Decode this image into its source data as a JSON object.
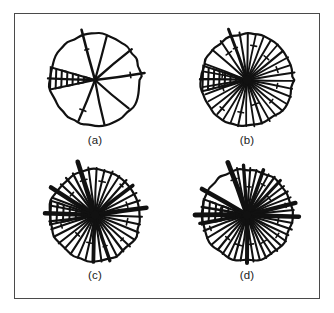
{
  "figure": {
    "title": "",
    "background_color": "#ffffff",
    "ink_color": "#111111",
    "frame_color": "#4a4a4a",
    "frame": {
      "x": 14,
      "y": 13,
      "width": 306,
      "height": 286
    },
    "layout": {
      "rows": 2,
      "cols": 2
    }
  },
  "panels": [
    {
      "id": "a",
      "caption": "(a)",
      "center": {
        "x": 70,
        "y": 58
      },
      "radius": 46,
      "spoke_count": 8,
      "description": "sparse radial diagram with eight spokes and one hatched wedge on the left",
      "hatched_wedge": {
        "start_angle": 168,
        "end_angle": 196,
        "zigzag_count": 7
      },
      "spokes": [
        {
          "angle": 255,
          "length": 52,
          "width": 2.6
        },
        {
          "angle": 285,
          "length": 46,
          "width": 2.2
        },
        {
          "angle": 320,
          "length": 48,
          "width": 2.4
        },
        {
          "angle": 352,
          "length": 50,
          "width": 2.6
        },
        {
          "angle": 40,
          "length": 44,
          "width": 2.2
        },
        {
          "angle": 78,
          "length": 46,
          "width": 2.2
        },
        {
          "angle": 112,
          "length": 44,
          "width": 2.2
        },
        {
          "angle": 182,
          "length": 47,
          "width": 2.4
        }
      ]
    },
    {
      "id": "b",
      "caption": "(b)",
      "center": {
        "x": 70,
        "y": 58
      },
      "radius": 46,
      "spoke_count": 34,
      "description": "dense radial diagram with about thirty-four spokes and a hatched wedge on the left",
      "hatched_wedge": {
        "start_angle": 166,
        "end_angle": 198,
        "zigzag_count": 7
      },
      "spokes": [
        {
          "angle": 250,
          "length": 54,
          "width": 3.0
        },
        {
          "angle": 261,
          "length": 48,
          "width": 2.0
        },
        {
          "angle": 271,
          "length": 47,
          "width": 2.0
        },
        {
          "angle": 281,
          "length": 46,
          "width": 1.8
        },
        {
          "angle": 291,
          "length": 47,
          "width": 1.8
        },
        {
          "angle": 301,
          "length": 46,
          "width": 2.0
        },
        {
          "angle": 311,
          "length": 47,
          "width": 1.8
        },
        {
          "angle": 321,
          "length": 46,
          "width": 2.2
        },
        {
          "angle": 331,
          "length": 47,
          "width": 1.8
        },
        {
          "angle": 341,
          "length": 46,
          "width": 1.8
        },
        {
          "angle": 351,
          "length": 48,
          "width": 2.2
        },
        {
          "angle": 1,
          "length": 47,
          "width": 1.8
        },
        {
          "angle": 11,
          "length": 46,
          "width": 1.8
        },
        {
          "angle": 21,
          "length": 47,
          "width": 2.0
        },
        {
          "angle": 31,
          "length": 46,
          "width": 1.8
        },
        {
          "angle": 41,
          "length": 47,
          "width": 2.0
        },
        {
          "angle": 51,
          "length": 46,
          "width": 1.8
        },
        {
          "angle": 61,
          "length": 47,
          "width": 1.8
        },
        {
          "angle": 71,
          "length": 46,
          "width": 2.2
        },
        {
          "angle": 81,
          "length": 47,
          "width": 1.8
        },
        {
          "angle": 91,
          "length": 46,
          "width": 1.8
        },
        {
          "angle": 101,
          "length": 47,
          "width": 2.0
        },
        {
          "angle": 111,
          "length": 46,
          "width": 1.8
        },
        {
          "angle": 121,
          "length": 46,
          "width": 1.8
        },
        {
          "angle": 131,
          "length": 45,
          "width": 2.0
        },
        {
          "angle": 141,
          "length": 45,
          "width": 1.8
        },
        {
          "angle": 151,
          "length": 44,
          "width": 1.8
        },
        {
          "angle": 161,
          "length": 44,
          "width": 2.0
        },
        {
          "angle": 171,
          "length": 45,
          "width": 1.8
        },
        {
          "angle": 181,
          "length": 47,
          "width": 2.4
        },
        {
          "angle": 191,
          "length": 45,
          "width": 1.8
        },
        {
          "angle": 201,
          "length": 45,
          "width": 1.8
        },
        {
          "angle": 221,
          "length": 46,
          "width": 2.0
        },
        {
          "angle": 236,
          "length": 47,
          "width": 2.0
        }
      ]
    },
    {
      "id": "c",
      "caption": "(c)",
      "center": {
        "x": 70,
        "y": 58
      },
      "radius": 46,
      "spoke_count": 36,
      "description": "dense radial diagram with several heavy bold spokes and a hatched wedge on the left",
      "hatched_wedge": {
        "start_angle": 168,
        "end_angle": 198,
        "zigzag_count": 6
      },
      "spokes": [
        {
          "angle": 252,
          "length": 56,
          "width": 4.6
        },
        {
          "angle": 262,
          "length": 48,
          "width": 2.0
        },
        {
          "angle": 272,
          "length": 47,
          "width": 2.0
        },
        {
          "angle": 282,
          "length": 46,
          "width": 2.0
        },
        {
          "angle": 292,
          "length": 47,
          "width": 2.0
        },
        {
          "angle": 302,
          "length": 46,
          "width": 2.0
        },
        {
          "angle": 312,
          "length": 47,
          "width": 2.2
        },
        {
          "angle": 322,
          "length": 48,
          "width": 3.6
        },
        {
          "angle": 332,
          "length": 47,
          "width": 2.0
        },
        {
          "angle": 342,
          "length": 47,
          "width": 2.2
        },
        {
          "angle": 352,
          "length": 52,
          "width": 4.4
        },
        {
          "angle": 2,
          "length": 47,
          "width": 2.0
        },
        {
          "angle": 12,
          "length": 46,
          "width": 2.0
        },
        {
          "angle": 22,
          "length": 47,
          "width": 2.2
        },
        {
          "angle": 32,
          "length": 46,
          "width": 2.0
        },
        {
          "angle": 42,
          "length": 47,
          "width": 2.0
        },
        {
          "angle": 52,
          "length": 46,
          "width": 2.2
        },
        {
          "angle": 62,
          "length": 47,
          "width": 2.0
        },
        {
          "angle": 72,
          "length": 48,
          "width": 3.4
        },
        {
          "angle": 82,
          "length": 47,
          "width": 2.0
        },
        {
          "angle": 92,
          "length": 47,
          "width": 3.8
        },
        {
          "angle": 102,
          "length": 46,
          "width": 2.0
        },
        {
          "angle": 112,
          "length": 46,
          "width": 2.0
        },
        {
          "angle": 122,
          "length": 46,
          "width": 2.2
        },
        {
          "angle": 132,
          "length": 45,
          "width": 2.0
        },
        {
          "angle": 142,
          "length": 46,
          "width": 2.0
        },
        {
          "angle": 152,
          "length": 46,
          "width": 2.2
        },
        {
          "angle": 162,
          "length": 46,
          "width": 2.0
        },
        {
          "angle": 172,
          "length": 46,
          "width": 2.2
        },
        {
          "angle": 182,
          "length": 50,
          "width": 4.6
        },
        {
          "angle": 192,
          "length": 46,
          "width": 2.0
        },
        {
          "angle": 202,
          "length": 46,
          "width": 2.0
        },
        {
          "angle": 212,
          "length": 52,
          "width": 4.4
        },
        {
          "angle": 222,
          "length": 46,
          "width": 2.0
        },
        {
          "angle": 232,
          "length": 47,
          "width": 2.2
        },
        {
          "angle": 242,
          "length": 47,
          "width": 2.2
        }
      ]
    },
    {
      "id": "d",
      "caption": "(d)",
      "center": {
        "x": 70,
        "y": 58
      },
      "radius": 46,
      "spoke_count": 38,
      "description": "densest radial diagram with many heavy bold spokes and a hatched wedge on the left",
      "hatched_wedge": {
        "start_angle": 168,
        "end_angle": 200,
        "zigzag_count": 6
      },
      "spokes": [
        {
          "angle": 250,
          "length": 56,
          "width": 4.8
        },
        {
          "angle": 258,
          "length": 48,
          "width": 2.0
        },
        {
          "angle": 266,
          "length": 50,
          "width": 3.4
        },
        {
          "angle": 274,
          "length": 47,
          "width": 2.0
        },
        {
          "angle": 282,
          "length": 46,
          "width": 2.0
        },
        {
          "angle": 290,
          "length": 48,
          "width": 3.6
        },
        {
          "angle": 298,
          "length": 46,
          "width": 2.0
        },
        {
          "angle": 306,
          "length": 47,
          "width": 2.2
        },
        {
          "angle": 314,
          "length": 48,
          "width": 3.2
        },
        {
          "angle": 322,
          "length": 47,
          "width": 2.0
        },
        {
          "angle": 330,
          "length": 47,
          "width": 2.2
        },
        {
          "angle": 338,
          "length": 47,
          "width": 2.0
        },
        {
          "angle": 346,
          "length": 50,
          "width": 4.2
        },
        {
          "angle": 354,
          "length": 47,
          "width": 2.0
        },
        {
          "angle": 2,
          "length": 52,
          "width": 4.4
        },
        {
          "angle": 10,
          "length": 46,
          "width": 2.0
        },
        {
          "angle": 18,
          "length": 47,
          "width": 2.2
        },
        {
          "angle": 26,
          "length": 46,
          "width": 2.0
        },
        {
          "angle": 34,
          "length": 47,
          "width": 2.0
        },
        {
          "angle": 42,
          "length": 46,
          "width": 2.2
        },
        {
          "angle": 50,
          "length": 47,
          "width": 2.0
        },
        {
          "angle": 58,
          "length": 46,
          "width": 2.0
        },
        {
          "angle": 66,
          "length": 47,
          "width": 2.2
        },
        {
          "angle": 74,
          "length": 46,
          "width": 2.0
        },
        {
          "angle": 82,
          "length": 47,
          "width": 2.0
        },
        {
          "angle": 90,
          "length": 48,
          "width": 4.0
        },
        {
          "angle": 98,
          "length": 46,
          "width": 2.0
        },
        {
          "angle": 106,
          "length": 46,
          "width": 2.2
        },
        {
          "angle": 114,
          "length": 46,
          "width": 2.0
        },
        {
          "angle": 122,
          "length": 46,
          "width": 2.0
        },
        {
          "angle": 130,
          "length": 45,
          "width": 2.2
        },
        {
          "angle": 140,
          "length": 46,
          "width": 2.0
        },
        {
          "angle": 150,
          "length": 46,
          "width": 2.0
        },
        {
          "angle": 160,
          "length": 46,
          "width": 2.2
        },
        {
          "angle": 170,
          "length": 48,
          "width": 3.2
        },
        {
          "angle": 180,
          "length": 52,
          "width": 4.8
        },
        {
          "angle": 190,
          "length": 46,
          "width": 2.4
        },
        {
          "angle": 210,
          "length": 52,
          "width": 4.6
        }
      ]
    }
  ]
}
